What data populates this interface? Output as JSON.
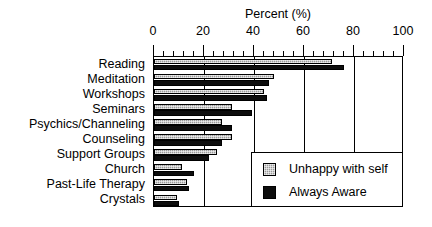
{
  "chart_data": {
    "type": "bar",
    "orientation": "horizontal",
    "title": "",
    "xlabel": "Percent (%)",
    "ylabel": "",
    "xlim": [
      0,
      100
    ],
    "xticks": [
      0,
      20,
      40,
      60,
      80,
      100
    ],
    "xtick_labels": [
      "0",
      "20",
      "40",
      "60",
      "80",
      "100"
    ],
    "minor_tick_step": 4,
    "grid": "vertical gridlines at 20, 40, 60, 80",
    "gridlines": [
      20,
      40,
      60,
      80
    ],
    "legend_position": "lower right (inside plot)",
    "categories": [
      "Reading",
      "Meditation",
      "Workshops",
      "Seminars",
      "Psychics/Channeling",
      "Counseling",
      "Support Groups",
      "Church",
      "Past-Life Therapy",
      "Crystals"
    ],
    "series": [
      {
        "name": "Unhappy with self",
        "color": "#9a9a9a",
        "pattern": "hatched-gray",
        "values": [
          71,
          48,
          44,
          31,
          27,
          31,
          25,
          11,
          13,
          9
        ]
      },
      {
        "name": "Always Aware",
        "color": "#0d0d0d",
        "pattern": "solid-black",
        "values": [
          76,
          46,
          45,
          39,
          31,
          27,
          22,
          16,
          14,
          10
        ]
      }
    ]
  },
  "legend": {
    "entries": [
      {
        "label": "Unhappy with self",
        "swatch": "hatched-gray-swatch"
      },
      {
        "label": "Always Aware",
        "swatch": "solid-black-swatch"
      }
    ]
  }
}
